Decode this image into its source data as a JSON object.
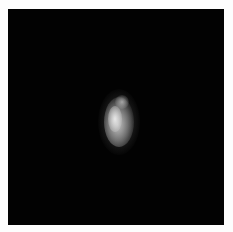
{
  "image": {
    "description": "Blurry bright irregular object on black background",
    "colors": {
      "background": "#020202",
      "border": "#fdfdfd",
      "highlight": "#e0e0e0"
    }
  }
}
